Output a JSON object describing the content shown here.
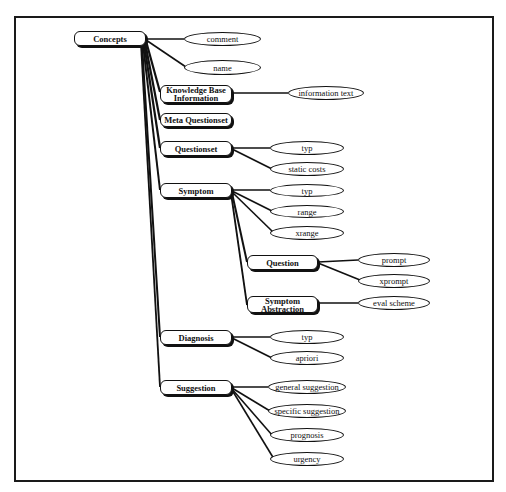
{
  "diagram": {
    "type": "concept-hierarchy",
    "root": {
      "label": "Concepts",
      "attributes": [
        "comment",
        "name"
      ],
      "children": [
        {
          "label": "Knowledge Base Information",
          "attributes": [
            "information text"
          ]
        },
        {
          "label": "Meta Questionset",
          "attributes": []
        },
        {
          "label": "Questionset",
          "attributes": [
            "typ",
            "static costs"
          ]
        },
        {
          "label": "Symptom",
          "attributes": [
            "typ",
            "range",
            "xrange"
          ],
          "children": [
            {
              "label": "Question",
              "attributes": [
                "prompt",
                "xprompt"
              ]
            },
            {
              "label": "Symptom Abstraction",
              "attributes": [
                "eval scheme"
              ]
            }
          ]
        },
        {
          "label": "Diagnosis",
          "attributes": [
            "typ",
            "apriori"
          ]
        },
        {
          "label": "Suggestion",
          "attributes": [
            "general suggestion",
            "specific suggestion",
            "prognosis",
            "urgency"
          ]
        }
      ]
    }
  },
  "nodes": {
    "concepts": "Concepts",
    "kbi_line1": "Knowledge Base",
    "kbi_line2": "Information",
    "meta_questionset": "Meta Questionset",
    "questionset": "Questionset",
    "symptom": "Symptom",
    "question": "Question",
    "symptom_abstraction_line1": "Symptom",
    "symptom_abstraction_line2": "Abstraction",
    "diagnosis": "Diagnosis",
    "suggestion": "Suggestion"
  },
  "attributes": {
    "comment": "comment",
    "name": "name",
    "information_text": "information text",
    "questionset_typ": "typ",
    "static_costs": "static costs",
    "symptom_typ": "typ",
    "range": "range",
    "xrange": "xrange",
    "prompt": "prompt",
    "xprompt": "xprompt",
    "eval_scheme": "eval scheme",
    "diagnosis_typ": "typ",
    "apriori": "apriori",
    "general_suggestion": "general suggestion",
    "specific_suggestion": "specific suggestion",
    "prognosis": "prognosis",
    "urgency": "urgency"
  }
}
